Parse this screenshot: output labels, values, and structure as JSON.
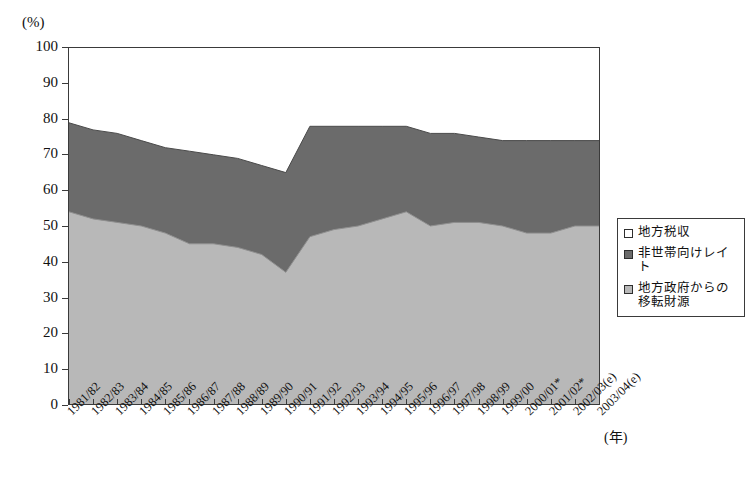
{
  "chart_data": {
    "type": "area",
    "stacked": true,
    "title": "",
    "subtitle": "",
    "xlabel": "(年)",
    "ylabel": "(%)",
    "ylim": [
      0,
      100
    ],
    "ytick_labels": [
      "100",
      "90",
      "80",
      "70",
      "60",
      "50",
      "40",
      "30",
      "20",
      "10",
      "0"
    ],
    "ytick_values": [
      100,
      90,
      80,
      70,
      60,
      50,
      40,
      30,
      20,
      10,
      0
    ],
    "grid": false,
    "legend_position": "right",
    "categories": [
      "1981/82",
      "1982/83",
      "1983/84",
      "1984/85",
      "1985/86",
      "1986/87",
      "1987/88",
      "1988/89",
      "1989/90",
      "1990/91",
      "1991/92",
      "1992/93",
      "1993/94",
      "1994/95",
      "1995/96",
      "1996/97",
      "1997/98",
      "1998/99",
      "1999/00",
      "2000/01*",
      "2001/02*",
      "2002/03(e)",
      "2003/04(e)"
    ],
    "series": [
      {
        "name": "地方政府からの移転財源",
        "color": "#b8b8b8",
        "values": [
          54,
          52,
          51,
          50,
          48,
          45,
          45,
          44,
          42,
          37,
          47,
          49,
          50,
          52,
          54,
          50,
          51,
          51,
          50,
          48,
          48,
          50,
          50
        ]
      },
      {
        "name": "非世帯向けレイト",
        "color": "#6b6b6b",
        "values": [
          25,
          25,
          25,
          24,
          24,
          26,
          25,
          25,
          25,
          28,
          31,
          29,
          28,
          26,
          24,
          26,
          25,
          24,
          24,
          26,
          26,
          24,
          24
        ]
      },
      {
        "name": "地方税収",
        "color": "#ffffff",
        "values": [
          21,
          23,
          24,
          26,
          28,
          29,
          30,
          31,
          33,
          35,
          22,
          22,
          22,
          22,
          22,
          24,
          24,
          25,
          26,
          26,
          26,
          26,
          26
        ]
      }
    ],
    "cumulative_upper_light": [
      54,
      52,
      51,
      50,
      48,
      45,
      45,
      44,
      42,
      37,
      47,
      49,
      50,
      52,
      54,
      50,
      51,
      51,
      50,
      48,
      48,
      50,
      50
    ],
    "cumulative_upper_dark": [
      79,
      77,
      76,
      74,
      72,
      71,
      70,
      69,
      67,
      65,
      78,
      78,
      78,
      78,
      78,
      76,
      76,
      75,
      74,
      74,
      74,
      74,
      74
    ]
  },
  "legend": {
    "items": [
      {
        "label": "地方税収",
        "color": "#ffffff"
      },
      {
        "label": "非世帯向けレイト",
        "color": "#6b6b6b"
      },
      {
        "label": "地方政府からの\n移転財源",
        "color": "#b8b8b8"
      }
    ]
  },
  "axes": {
    "y_unit": "(%)",
    "x_unit": "(年)"
  }
}
